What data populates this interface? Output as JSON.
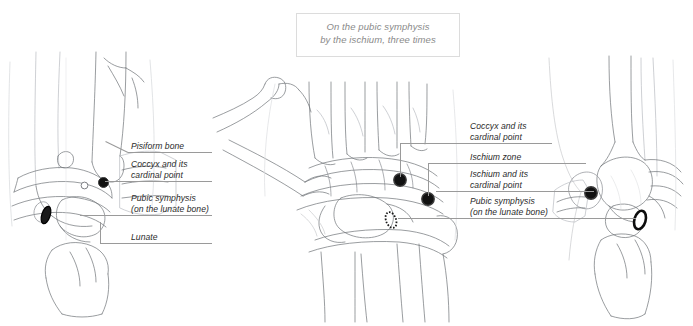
{
  "caption": {
    "line1": "On the pubic symphysis",
    "line2": "by the ischium, three times"
  },
  "left_labels": [
    {
      "id": "pisiform-bone",
      "line1": "Pisiform bone",
      "line2": ""
    },
    {
      "id": "coccyx-cardinal-point",
      "line1": "Coccyx and its",
      "line2": "cardinal point"
    },
    {
      "id": "pubic-symphysis-lunate",
      "line1": "Pubic symphysis",
      "line2": "(on the lunate bone)"
    },
    {
      "id": "lunate",
      "line1": "Lunate",
      "line2": ""
    }
  ],
  "right_labels": [
    {
      "id": "coccyx-cardinal-point",
      "line1": "Coccyx and its",
      "line2": "cardinal point"
    },
    {
      "id": "ischium-zone",
      "line1": "Ischium zone",
      "line2": ""
    },
    {
      "id": "ischium-cardinal-point",
      "line1": "Ischium and its",
      "line2": "cardinal point"
    },
    {
      "id": "pubic-symphysis-lunate",
      "line1": "Pubic symphysis",
      "line2": "(on the lunate bone)"
    }
  ],
  "panels": [
    {
      "id": "left-lateral-wrist",
      "view": "lateral wrist, left"
    },
    {
      "id": "center-dorsal-wrist",
      "view": "dorsal wrist, palmar-anterior"
    },
    {
      "id": "right-lateral-wrist",
      "view": "lateral wrist, mirrored"
    }
  ],
  "markers": [
    {
      "id": "left-cardinal-dot",
      "panel": "left-lateral-wrist",
      "style": "filled-dot"
    },
    {
      "id": "left-small-circle",
      "panel": "left-lateral-wrist",
      "style": "open-small-circle"
    },
    {
      "id": "left-pisiform-ellipse",
      "panel": "left-lateral-wrist",
      "style": "filled-ellipse"
    },
    {
      "id": "center-coccyx-dot",
      "panel": "center-dorsal-wrist",
      "style": "filled-dot"
    },
    {
      "id": "center-ischium-dot",
      "panel": "center-dorsal-wrist",
      "style": "filled-dot"
    },
    {
      "id": "center-lunate-ellipse",
      "panel": "center-dorsal-wrist",
      "style": "dashed-ellipse"
    },
    {
      "id": "right-cardinal-dot",
      "panel": "right-lateral-wrist",
      "style": "filled-dot"
    },
    {
      "id": "right-lunate-ellipse",
      "panel": "right-lateral-wrist",
      "style": "open-ellipse"
    }
  ],
  "colors": {
    "background": "#ffffff",
    "bone_stroke": "#6f7277",
    "bone_stroke_light": "#b9bcc1",
    "leader_line": "#9a9a9a",
    "caption_text": "#8a8a8a",
    "caption_border": "#dcdcdc",
    "label_text": "#2b2b2b",
    "marker_fill": "#111111",
    "marker_rim": "#3a3a3a"
  }
}
